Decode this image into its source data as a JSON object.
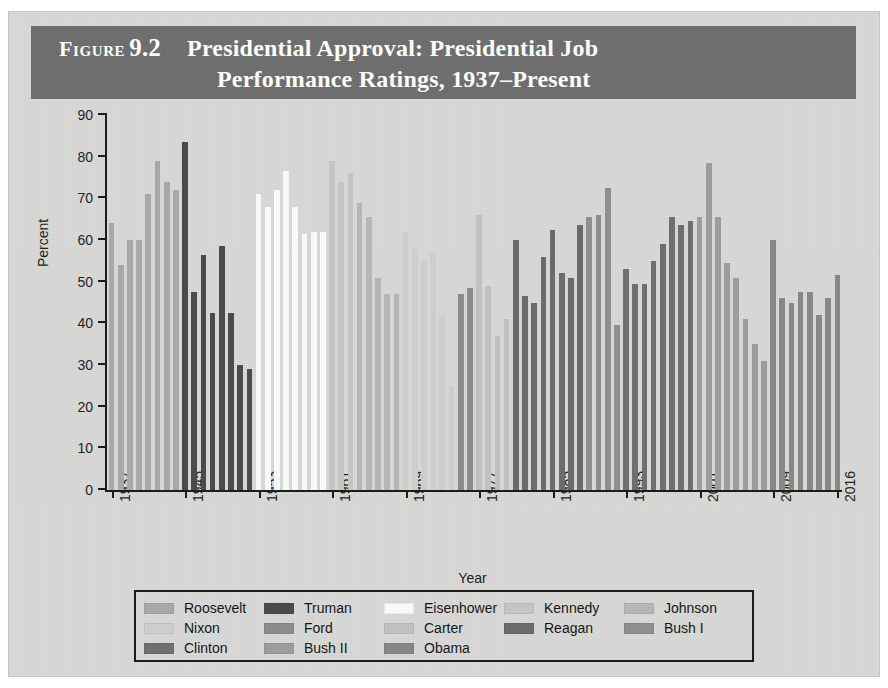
{
  "header": {
    "figure_word": "Figure",
    "figure_number": "9.2",
    "title_line1": "Presidential Approval: Presidential Job",
    "title_line2": "Performance Ratings, 1937–Present",
    "band_color": "#6e6e6e"
  },
  "legend": {
    "rows": [
      [
        {
          "label": "Roosevelt",
          "color": "#a9a9a7"
        },
        {
          "label": "Truman",
          "color": "#4a4a4a"
        },
        {
          "label": "Eisenhower",
          "color": "#fbfbf9"
        },
        {
          "label": "Kennedy",
          "color": "#c6c6c3"
        },
        {
          "label": "Johnson",
          "color": "#b7b7b4"
        }
      ],
      [
        {
          "label": "Nixon",
          "color": "#cfcfcc"
        },
        {
          "label": "Ford",
          "color": "#8c8c8a"
        },
        {
          "label": "Carter",
          "color": "#c2c2bf"
        },
        {
          "label": "Reagan",
          "color": "#6b6b6b"
        },
        {
          "label": "Bush I",
          "color": "#8f8f8d"
        }
      ],
      [
        {
          "label": "Clinton",
          "color": "#6f6f6f"
        },
        {
          "label": "Bush II",
          "color": "#9d9d9b"
        },
        {
          "label": "Obama",
          "color": "#878785"
        }
      ]
    ]
  },
  "chart_data": {
    "type": "bar",
    "title": "Presidential Approval: Presidential Job Performance Ratings, 1937–Present",
    "xlabel": "Year",
    "ylabel": "Percent",
    "ylim": [
      0,
      90
    ],
    "yticks": [
      0,
      10,
      20,
      30,
      40,
      50,
      60,
      70,
      80,
      90
    ],
    "xticks": [
      1937,
      1945,
      1953,
      1961,
      1969,
      1977,
      1985,
      1993,
      2001,
      2009,
      2016
    ],
    "x_range": [
      1937,
      2016
    ],
    "grid": false,
    "legend_position": "below-plot",
    "series": [
      {
        "name": "Roosevelt",
        "color": "#a9a9a7",
        "points": [
          {
            "year": 1937,
            "value": 64
          },
          {
            "year": 1938,
            "value": 54
          },
          {
            "year": 1939,
            "value": 60
          },
          {
            "year": 1940,
            "value": 60
          },
          {
            "year": 1941,
            "value": 71
          },
          {
            "year": 1942,
            "value": 79
          },
          {
            "year": 1943,
            "value": 74
          },
          {
            "year": 1944,
            "value": 72
          }
        ]
      },
      {
        "name": "Truman",
        "color": "#4a4a4a",
        "points": [
          {
            "year": 1945,
            "value": 83.5
          },
          {
            "year": 1946,
            "value": 47.5
          },
          {
            "year": 1947,
            "value": 56.5
          },
          {
            "year": 1948,
            "value": 42.5
          },
          {
            "year": 1949,
            "value": 58.5
          },
          {
            "year": 1950,
            "value": 42.5
          },
          {
            "year": 1951,
            "value": 30
          },
          {
            "year": 1952,
            "value": 29
          }
        ]
      },
      {
        "name": "Eisenhower",
        "color": "#fbfbf9",
        "points": [
          {
            "year": 1953,
            "value": 71
          },
          {
            "year": 1954,
            "value": 68
          },
          {
            "year": 1955,
            "value": 72
          },
          {
            "year": 1956,
            "value": 76.5
          },
          {
            "year": 1957,
            "value": 68
          },
          {
            "year": 1958,
            "value": 61.5
          },
          {
            "year": 1959,
            "value": 62
          },
          {
            "year": 1960,
            "value": 62
          }
        ]
      },
      {
        "name": "Kennedy",
        "color": "#c6c6c3",
        "points": [
          {
            "year": 1961,
            "value": 79
          },
          {
            "year": 1962,
            "value": 74
          },
          {
            "year": 1963,
            "value": 76
          }
        ]
      },
      {
        "name": "Johnson",
        "color": "#b7b7b4",
        "points": [
          {
            "year": 1964,
            "value": 69
          },
          {
            "year": 1965,
            "value": 65.5
          },
          {
            "year": 1966,
            "value": 51
          },
          {
            "year": 1967,
            "value": 47
          },
          {
            "year": 1968,
            "value": 47
          }
        ]
      },
      {
        "name": "Nixon",
        "color": "#cfcfcc",
        "points": [
          {
            "year": 1969,
            "value": 62
          },
          {
            "year": 1970,
            "value": 58
          },
          {
            "year": 1971,
            "value": 55
          },
          {
            "year": 1972,
            "value": 57
          },
          {
            "year": 1973,
            "value": 42
          },
          {
            "year": 1974,
            "value": 25
          }
        ]
      },
      {
        "name": "Ford",
        "color": "#8c8c8a",
        "points": [
          {
            "year": 1975,
            "value": 47
          },
          {
            "year": 1976,
            "value": 48.5
          }
        ]
      },
      {
        "name": "Carter",
        "color": "#c2c2bf",
        "points": [
          {
            "year": 1977,
            "value": 66
          },
          {
            "year": 1978,
            "value": 49
          },
          {
            "year": 1979,
            "value": 37
          },
          {
            "year": 1980,
            "value": 41
          }
        ]
      },
      {
        "name": "Reagan",
        "color": "#6b6b6b",
        "points": [
          {
            "year": 1981,
            "value": 60
          },
          {
            "year": 1982,
            "value": 46.5
          },
          {
            "year": 1983,
            "value": 45
          },
          {
            "year": 1984,
            "value": 56
          },
          {
            "year": 1985,
            "value": 62.5
          },
          {
            "year": 1986,
            "value": 52
          },
          {
            "year": 1987,
            "value": 51
          },
          {
            "year": 1988,
            "value": 63.5
          }
        ]
      },
      {
        "name": "Bush I",
        "color": "#8f8f8d",
        "points": [
          {
            "year": 1989,
            "value": 65.5
          },
          {
            "year": 1990,
            "value": 66
          },
          {
            "year": 1991,
            "value": 72.5
          },
          {
            "year": 1992,
            "value": 39.5
          }
        ]
      },
      {
        "name": "Clinton",
        "color": "#6f6f6f",
        "points": [
          {
            "year": 1993,
            "value": 53
          },
          {
            "year": 1994,
            "value": 49.5
          },
          {
            "year": 1995,
            "value": 49.5
          },
          {
            "year": 1996,
            "value": 55
          },
          {
            "year": 1997,
            "value": 59
          },
          {
            "year": 1998,
            "value": 65.5
          },
          {
            "year": 1999,
            "value": 63.5
          },
          {
            "year": 2000,
            "value": 64.5
          }
        ]
      },
      {
        "name": "Bush II",
        "color": "#9d9d9b",
        "points": [
          {
            "year": 2001,
            "value": 65.5
          },
          {
            "year": 2002,
            "value": 78.5
          },
          {
            "year": 2003,
            "value": 65.5
          },
          {
            "year": 2004,
            "value": 54.5
          },
          {
            "year": 2005,
            "value": 51
          },
          {
            "year": 2006,
            "value": 41
          },
          {
            "year": 2007,
            "value": 35
          },
          {
            "year": 2008,
            "value": 31
          }
        ]
      },
      {
        "name": "Obama",
        "color": "#878785",
        "points": [
          {
            "year": 2009,
            "value": 60
          },
          {
            "year": 2010,
            "value": 46
          },
          {
            "year": 2011,
            "value": 45
          },
          {
            "year": 2012,
            "value": 47.5
          },
          {
            "year": 2013,
            "value": 47.5
          },
          {
            "year": 2014,
            "value": 42
          },
          {
            "year": 2015,
            "value": 46
          },
          {
            "year": 2016,
            "value": 51.5
          }
        ]
      }
    ]
  }
}
